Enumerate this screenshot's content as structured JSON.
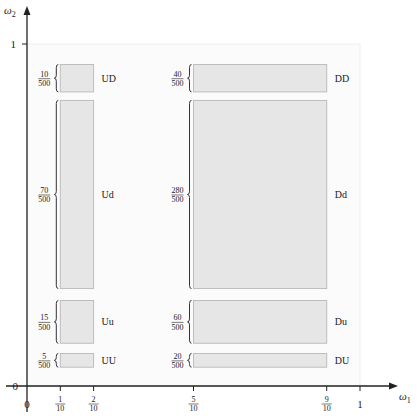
{
  "axes": {
    "x_label": "ω",
    "x_label_sub": "1",
    "y_label": "ω",
    "y_label_sub": "2",
    "origin_x_label": "0",
    "origin_y_label": "0",
    "y_one_label": "1",
    "x_ticks": [
      {
        "value": 0.1,
        "num": "1",
        "den": "10"
      },
      {
        "value": 0.2,
        "num": "2",
        "den": "10"
      },
      {
        "value": 0.5,
        "num": "5",
        "den": "10"
      },
      {
        "value": 0.9,
        "num": "9",
        "den": "10"
      }
    ],
    "x_one_label": "1"
  },
  "regions": [
    {
      "name": "UD",
      "x0": 0.1,
      "x1": 0.2,
      "y0": 0.86,
      "y1": 0.94,
      "num": "10",
      "den": "500"
    },
    {
      "name": "Ud",
      "x0": 0.1,
      "x1": 0.2,
      "y0": 0.285,
      "y1": 0.835,
      "num": "70",
      "den": "500"
    },
    {
      "name": "Uu",
      "x0": 0.1,
      "x1": 0.2,
      "y0": 0.125,
      "y1": 0.25,
      "num": "15",
      "den": "500"
    },
    {
      "name": "UU",
      "x0": 0.1,
      "x1": 0.2,
      "y0": 0.055,
      "y1": 0.095,
      "num": "5",
      "den": "500"
    },
    {
      "name": "DD",
      "x0": 0.5,
      "x1": 0.9,
      "y0": 0.86,
      "y1": 0.94,
      "num": "40",
      "den": "500"
    },
    {
      "name": "Dd",
      "x0": 0.5,
      "x1": 0.9,
      "y0": 0.285,
      "y1": 0.835,
      "num": "280",
      "den": "500"
    },
    {
      "name": "Du",
      "x0": 0.5,
      "x1": 0.9,
      "y0": 0.125,
      "y1": 0.25,
      "num": "60",
      "den": "500"
    },
    {
      "name": "DU",
      "x0": 0.5,
      "x1": 0.9,
      "y0": 0.055,
      "y1": 0.095,
      "num": "20",
      "den": "500"
    }
  ],
  "colors": {
    "region_fill": "#e6e6e6",
    "region_stroke": "#bdbdbd",
    "axis": "#222222",
    "frame": "#eeeeee"
  }
}
